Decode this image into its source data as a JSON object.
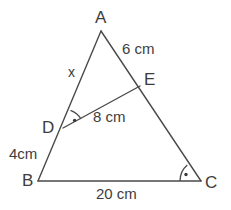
{
  "figure": {
    "type": "triangle-with-cevian",
    "background_color": "#ffffff",
    "line_color": "#4a4a4a",
    "text_color": "#3d3d3d"
  },
  "vertices": {
    "A": {
      "label": "A",
      "x": 101,
      "y": 31
    },
    "B": {
      "label": "B",
      "x": 38,
      "y": 181
    },
    "C": {
      "label": "C",
      "x": 201,
      "y": 181
    },
    "D": {
      "label": "D",
      "x": 63,
      "y": 128
    },
    "E": {
      "label": "E",
      "x": 140,
      "y": 86
    }
  },
  "segments": [
    {
      "name": "AB",
      "from": "A",
      "to": "B"
    },
    {
      "name": "AC",
      "from": "A",
      "to": "C"
    },
    {
      "name": "BC",
      "from": "B",
      "to": "C"
    },
    {
      "name": "DE",
      "from": "D",
      "to": "E"
    }
  ],
  "measurements": {
    "AE": "6 cm",
    "DE": "8 cm",
    "DB": "4cm",
    "BC": "20 cm",
    "AD": "x"
  },
  "right_angles": [
    {
      "at": "D",
      "between": "AD and DE",
      "marker": "arc-with-dot"
    },
    {
      "at": "C",
      "between": "BC and CE",
      "marker": "arc-with-dot"
    }
  ]
}
